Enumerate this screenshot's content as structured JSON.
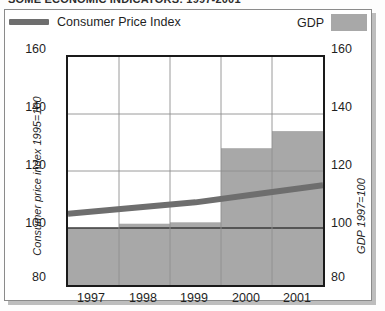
{
  "title_partial": "SOME ECONOMIC INDICATORS: 1997-2001",
  "legend": {
    "line_label": "Consumer Price Index",
    "bar_label": "GDP",
    "line_color": "#6e6e6e",
    "bar_color": "#a8a8a8"
  },
  "axes": {
    "left_title": "Consumer price index 1995=100",
    "right_title": "GDP 1997=100",
    "ticks": [
      "160",
      "140",
      "120",
      "100",
      "80"
    ]
  },
  "chart_data": {
    "type": "bar",
    "title": "",
    "subtitle": "",
    "xlabel": "",
    "ylabel": "Consumer price index 1995=100",
    "y2label": "GDP 1997=100",
    "categories": [
      "1997",
      "1998",
      "1999",
      "2000",
      "2001"
    ],
    "ylim": [
      80,
      160
    ],
    "y2lim": [
      80,
      160
    ],
    "yticks": [
      80,
      100,
      120,
      140,
      160
    ],
    "grid": true,
    "legend_position": "top",
    "series": [
      {
        "name": "GDP",
        "type": "bar",
        "axis": "right",
        "color": "#a8a8a8",
        "values": [
          100,
          101.5,
          102,
          128,
          134
        ]
      },
      {
        "name": "Consumer Price Index",
        "type": "line",
        "axis": "left",
        "color": "#6e6e6e",
        "x": [
          "1997",
          "1998",
          "1999",
          "2000",
          "2001"
        ],
        "values": [
          105,
          107,
          109,
          112,
          115
        ]
      }
    ],
    "annotations": []
  }
}
